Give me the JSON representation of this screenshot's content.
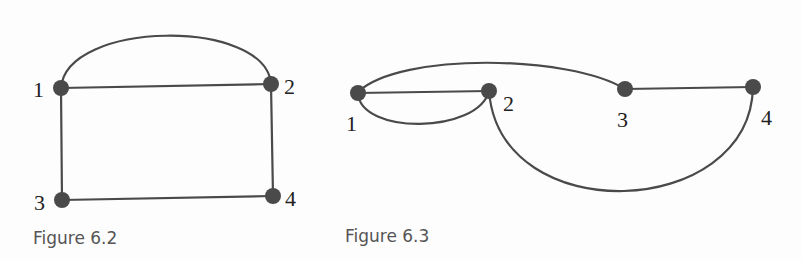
{
  "figures": [
    {
      "caption": "Figure 6.2",
      "nodes": [
        {
          "id": "1",
          "label": "1"
        },
        {
          "id": "2",
          "label": "2"
        },
        {
          "id": "3",
          "label": "3"
        },
        {
          "id": "4",
          "label": "4"
        }
      ],
      "edges": [
        {
          "from": "1",
          "to": "2",
          "shape": "arc-above"
        },
        {
          "from": "1",
          "to": "2",
          "shape": "straight"
        },
        {
          "from": "1",
          "to": "3",
          "shape": "straight"
        },
        {
          "from": "2",
          "to": "4",
          "shape": "straight"
        },
        {
          "from": "3",
          "to": "4",
          "shape": "straight"
        }
      ]
    },
    {
      "caption": "Figure 6.3",
      "nodes": [
        {
          "id": "1",
          "label": "1"
        },
        {
          "id": "2",
          "label": "2"
        },
        {
          "id": "3",
          "label": "3"
        },
        {
          "id": "4",
          "label": "4"
        }
      ],
      "edges": [
        {
          "from": "1",
          "to": "2",
          "shape": "straight"
        },
        {
          "from": "1",
          "to": "2",
          "shape": "loop-below"
        },
        {
          "from": "1",
          "to": "3",
          "shape": "arc-above"
        },
        {
          "from": "3",
          "to": "4",
          "shape": "straight"
        },
        {
          "from": "2",
          "to": "4",
          "shape": "arc-below"
        }
      ]
    }
  ]
}
